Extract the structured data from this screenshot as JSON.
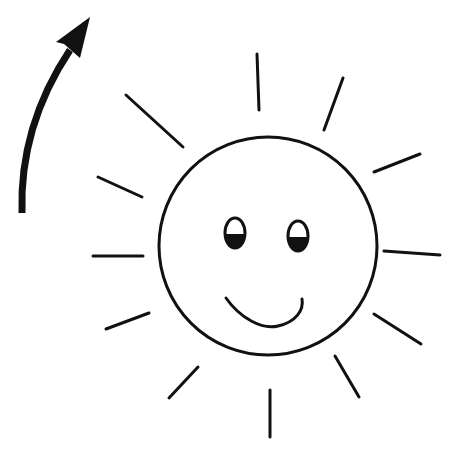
{
  "illustration": {
    "subject": "smiling sun with curved arrow",
    "background": "#ffffff",
    "stroke_color": "#111111",
    "sun": {
      "face_circle": {
        "cx": 268,
        "cy": 246,
        "r": 109
      },
      "rays": [
        {
          "x1": 257,
          "y1": 54,
          "x2": 259,
          "y2": 110
        },
        {
          "x1": 343,
          "y1": 78,
          "x2": 324,
          "y2": 130
        },
        {
          "x1": 420,
          "y1": 154,
          "x2": 374,
          "y2": 172
        },
        {
          "x1": 384,
          "y1": 251,
          "x2": 440,
          "y2": 255
        },
        {
          "x1": 374,
          "y1": 314,
          "x2": 421,
          "y2": 344
        },
        {
          "x1": 335,
          "y1": 356,
          "x2": 359,
          "y2": 397
        },
        {
          "x1": 270,
          "y1": 390,
          "x2": 270,
          "y2": 437
        },
        {
          "x1": 198,
          "y1": 367,
          "x2": 169,
          "y2": 398
        },
        {
          "x1": 149,
          "y1": 313,
          "x2": 106,
          "y2": 329
        },
        {
          "x1": 143,
          "y1": 256,
          "x2": 93,
          "y2": 256
        },
        {
          "x1": 142,
          "y1": 197,
          "x2": 98,
          "y2": 177
        },
        {
          "x1": 183,
          "y1": 147,
          "x2": 126,
          "y2": 95
        }
      ],
      "eyes": [
        {
          "cx": 235,
          "cy": 233,
          "rx": 10,
          "ry": 15
        },
        {
          "cx": 298,
          "cy": 236,
          "rx": 10,
          "ry": 15
        }
      ],
      "smile": {
        "path": "M226 298 C 240 318, 262 330, 278 326 C 296 322, 304 310, 302 299"
      }
    },
    "arrow": {
      "shaft_path": "M22 213 C 20 150, 40 95, 70 50",
      "head_points": "90,17 56,42 64,44 80,58"
    }
  }
}
